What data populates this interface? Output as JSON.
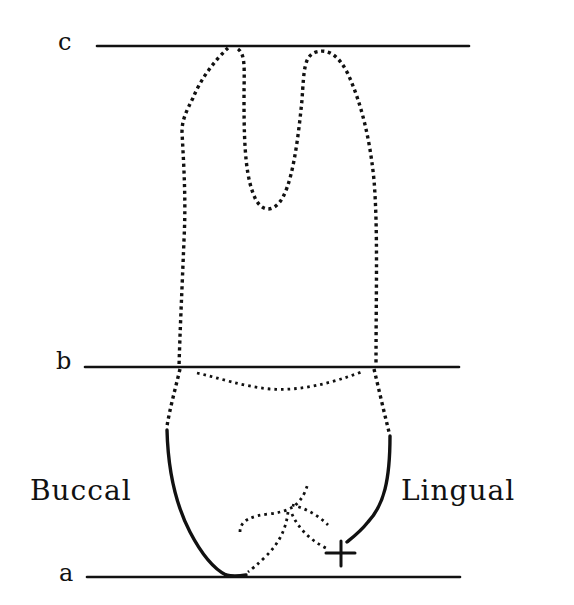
{
  "diagram": {
    "type": "tooth-cross-section",
    "reference_lines": [
      {
        "id": "c",
        "label": "c",
        "y": 46,
        "x1": 97,
        "x2": 469
      },
      {
        "id": "b",
        "label": "b",
        "y": 367,
        "x1": 85,
        "x2": 459
      },
      {
        "id": "a",
        "label": "a",
        "y": 577,
        "x1": 87,
        "x2": 460
      }
    ],
    "side_labels": {
      "left": "Buccal",
      "right": "Lingual"
    },
    "marker": {
      "symbol": "+",
      "meaning": "cross-mark"
    },
    "colors": {
      "ink": "#111111",
      "background": "#ffffff"
    }
  }
}
